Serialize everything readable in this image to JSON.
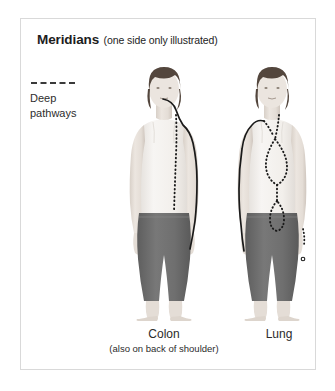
{
  "panel": {
    "border_color": "#d9d9d9",
    "background": "#ffffff"
  },
  "title": {
    "main": "Meridians",
    "subtitle": "(one side only illustrated)"
  },
  "legend": {
    "swatch": "dashed-line-swatch",
    "line1": "Deep",
    "line2": "pathways",
    "dash_color": "#3a3a3a"
  },
  "figures": [
    {
      "id": "colon",
      "alt": "front view of woman in white tank top and grey capri pants",
      "meridian_name": "Colon",
      "solid_path_description": "solid line from mouth over side of neck across shoulder and down outer arm to hand",
      "dotted_path_description": "deep pathway dotted line descending centre of torso",
      "skin_color": "#e8e2dc",
      "top_color": "#f2efec",
      "pants_color": "#6e6e6e",
      "hair_color": "#4a3f38",
      "line_color": "#1a1a1a"
    },
    {
      "id": "lung",
      "alt": "front view of woman in white tank top and grey capri pants",
      "meridian_name": "Lung",
      "solid_path_description": "solid line from shoulder down front of arm to thumb",
      "dotted_path_description": "deep pathway dotted line looping through chest and abdomen",
      "skin_color": "#e8e2dc",
      "top_color": "#f2efec",
      "pants_color": "#6e6e6e",
      "hair_color": "#4a3f38",
      "line_color": "#1a1a1a"
    }
  ],
  "captions": {
    "colon": {
      "label": "Colon",
      "note": "(also on back of shoulder)"
    },
    "lung": {
      "label": "Lung",
      "note": ""
    }
  }
}
